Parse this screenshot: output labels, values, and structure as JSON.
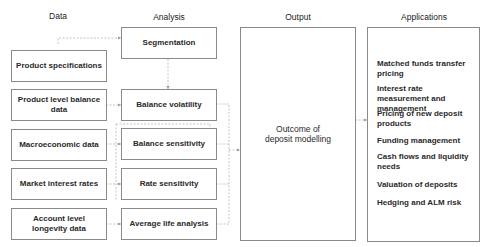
{
  "columns": {
    "data": "Data",
    "analysis": "Analysis",
    "output": "Output",
    "applications": "Applications"
  },
  "data_items": [
    "Product specifications",
    "Product level balance data",
    "Macroeconomic data",
    "Market interest rates",
    "Account level longevity data"
  ],
  "analysis_items": [
    "Segmentation",
    "Balance volatility",
    "Balance sensitivity",
    "Rate sensitivity",
    "Average life analysis"
  ],
  "output": {
    "line1": "Outcome of",
    "line2": "deposit modelling"
  },
  "applications": [
    "Matched funds transfer pricing",
    "Interest rate measurement and management",
    "Pricing of new deposit products",
    "Funding management",
    "Cash flows and liquidity needs",
    "Valuation of deposits",
    "Hedging and ALM risk"
  ],
  "colors": {
    "border": "#8a8a8a",
    "connector": "#b0b0b0",
    "text": "#2a2a2a"
  }
}
